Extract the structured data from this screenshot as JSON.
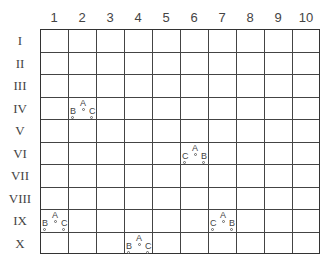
{
  "columns": [
    "1",
    "2",
    "3",
    "4",
    "5",
    "6",
    "7",
    "8",
    "9",
    "10"
  ],
  "rows": [
    "I",
    "II",
    "III",
    "IV",
    "V",
    "VI",
    "VII",
    "VIII",
    "IX",
    "X"
  ],
  "markers": [
    {
      "col": 2,
      "row": 4,
      "left": "B",
      "top": "A",
      "right": "C"
    },
    {
      "col": 6,
      "row": 6,
      "left": "C",
      "top": "A",
      "right": "B"
    },
    {
      "col": 1,
      "row": 9,
      "left": "B",
      "top": "A",
      "right": "C"
    },
    {
      "col": 7,
      "row": 9,
      "left": "C",
      "top": "A",
      "right": "B"
    },
    {
      "col": 4,
      "row": 10,
      "left": "B",
      "top": "A",
      "right": "C"
    }
  ]
}
